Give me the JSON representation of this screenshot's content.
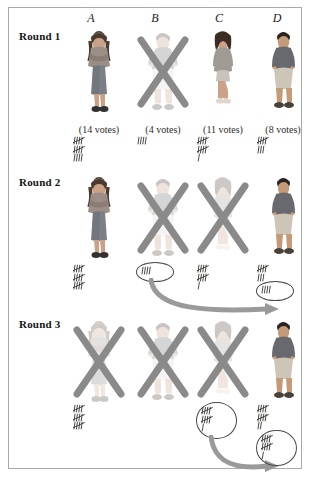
{
  "figure": {
    "type": "instant-runoff-voting-diagram",
    "border_color": "#a9a9a9",
    "background": "#ffffff",
    "ink_color": "#2b2b2b",
    "xmark_color": "#8a8a8a",
    "arrow_color": "#8f8f8f"
  },
  "columns": [
    {
      "id": "A",
      "label": "A"
    },
    {
      "id": "B",
      "label": "B"
    },
    {
      "id": "C",
      "label": "C"
    },
    {
      "id": "D",
      "label": "D"
    }
  ],
  "rounds": [
    {
      "label": "Round 1",
      "candidates": [
        {
          "column": "A",
          "person": "woman-arms-crossed",
          "eliminated": false,
          "votes_caption": "(14 votes)",
          "votes_total": 14,
          "tally_rows": [
            {
              "groups": 5,
              "ones": 0,
              "circled": false
            },
            {
              "groups": 5,
              "ones": 0,
              "circled": false
            },
            {
              "groups": 4,
              "ones": 0,
              "circled": false
            }
          ],
          "circled_tally": null,
          "arrow_to": null
        },
        {
          "column": "B",
          "person": "man-hands-on-hips",
          "eliminated": true,
          "votes_caption": "(4 votes)",
          "votes_total": 4,
          "tally_rows": [
            {
              "groups": 4,
              "ones": 0,
              "circled": false
            }
          ],
          "circled_tally": null,
          "arrow_to": null
        },
        {
          "column": "C",
          "person": "woman-standing",
          "eliminated": false,
          "votes_caption": "(11 votes)",
          "votes_total": 11,
          "tally_rows": [
            {
              "groups": 5,
              "ones": 0,
              "circled": false
            },
            {
              "groups": 5,
              "ones": 0,
              "circled": false
            },
            {
              "groups": 0,
              "ones": 1,
              "circled": false
            }
          ],
          "circled_tally": null,
          "arrow_to": null
        },
        {
          "column": "D",
          "person": "man-standing",
          "eliminated": false,
          "votes_caption": "(8 votes)",
          "votes_total": 8,
          "tally_rows": [
            {
              "groups": 5,
              "ones": 0,
              "circled": false
            },
            {
              "groups": 3,
              "ones": 0,
              "circled": false
            }
          ],
          "circled_tally": null,
          "arrow_to": null
        }
      ]
    },
    {
      "label": "Round 2",
      "candidates": [
        {
          "column": "A",
          "person": "woman-arms-crossed",
          "eliminated": false,
          "votes_caption": "",
          "votes_total": 15,
          "tally_rows": [
            {
              "groups": 5,
              "ones": 0,
              "circled": false
            },
            {
              "groups": 5,
              "ones": 0,
              "circled": false
            },
            {
              "groups": 5,
              "ones": 0,
              "circled": false
            }
          ],
          "circled_tally": null,
          "arrow_to": null
        },
        {
          "column": "B",
          "person": "man-hands-on-hips",
          "eliminated": true,
          "votes_caption": "",
          "votes_total": 4,
          "tally_rows": [],
          "circled_tally": {
            "groups": 4,
            "ones": 0
          },
          "arrow_to": "D"
        },
        {
          "column": "C",
          "person": "woman-standing",
          "eliminated": true,
          "votes_caption": "",
          "votes_total": 11,
          "tally_rows": [
            {
              "groups": 5,
              "ones": 0,
              "circled": false
            },
            {
              "groups": 5,
              "ones": 0,
              "circled": false
            },
            {
              "groups": 0,
              "ones": 1,
              "circled": false
            }
          ],
          "circled_tally": null,
          "arrow_to": null
        },
        {
          "column": "D",
          "person": "man-standing",
          "eliminated": false,
          "votes_caption": "",
          "votes_total": 12,
          "tally_rows": [
            {
              "groups": 5,
              "ones": 0,
              "circled": false
            },
            {
              "groups": 3,
              "ones": 0,
              "circled": false
            }
          ],
          "circled_tally": {
            "groups": 4,
            "ones": 0
          },
          "arrow_to": null
        }
      ]
    },
    {
      "label": "Round 3",
      "candidates": [
        {
          "column": "A",
          "person": "woman-arms-crossed",
          "eliminated": true,
          "votes_caption": "",
          "votes_total": 15,
          "tally_rows": [
            {
              "groups": 5,
              "ones": 0,
              "circled": false
            },
            {
              "groups": 5,
              "ones": 0,
              "circled": false
            },
            {
              "groups": 5,
              "ones": 0,
              "circled": false
            }
          ],
          "circled_tally": null,
          "arrow_to": null
        },
        {
          "column": "B",
          "person": "man-hands-on-hips",
          "eliminated": true,
          "votes_caption": "",
          "votes_total": 0,
          "tally_rows": [],
          "circled_tally": null,
          "arrow_to": null
        },
        {
          "column": "C",
          "person": "woman-standing",
          "eliminated": true,
          "votes_caption": "",
          "votes_total": 11,
          "tally_rows": [],
          "circled_tally": {
            "groups": 5,
            "ones": 1,
            "rows": [
              5,
              5,
              1
            ]
          },
          "arrow_to": "D"
        },
        {
          "column": "D",
          "person": "man-standing",
          "eliminated": false,
          "votes_caption": "",
          "votes_total": 23,
          "tally_rows": [
            {
              "groups": 5,
              "ones": 0,
              "circled": false
            },
            {
              "groups": 5,
              "ones": 0,
              "circled": false
            },
            {
              "groups": 2,
              "ones": 0,
              "circled": false
            }
          ],
          "circled_tally": {
            "groups": 5,
            "ones": 1,
            "rows": [
              5,
              5,
              1
            ]
          },
          "arrow_to": null
        }
      ]
    }
  ],
  "chart_data": {
    "type": "table",
    "categories": [
      "A",
      "B",
      "C",
      "D"
    ],
    "series": [
      {
        "name": "Round 1",
        "values": [
          14,
          4,
          11,
          8
        ]
      },
      {
        "name": "Round 2",
        "values": [
          15,
          0,
          11,
          12
        ]
      },
      {
        "name": "Round 3",
        "values": [
          15,
          0,
          0,
          23
        ]
      }
    ],
    "eliminated_by_round": {
      "Round 1": [
        "B"
      ],
      "Round 2": [
        "B",
        "C"
      ],
      "Round 3": [
        "A",
        "B",
        "C"
      ]
    },
    "transfers": [
      {
        "round": "Round 2",
        "from": "B",
        "to": "D",
        "votes": 4
      },
      {
        "round": "Round 3",
        "from": "C",
        "to": "D",
        "votes": 11
      }
    ],
    "winner": "D",
    "xlabel": "Candidate",
    "ylabel": "Votes",
    "legend_position": "none",
    "grid": false
  }
}
